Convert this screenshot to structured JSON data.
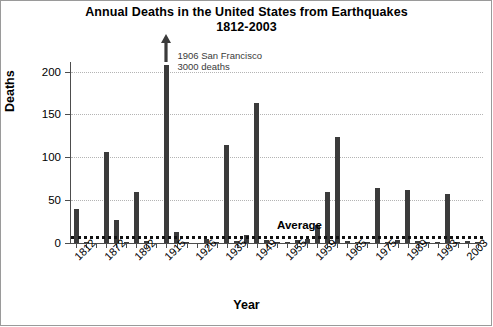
{
  "chart_data": {
    "type": "bar",
    "title": "Annual Deaths in the United States from Earthquakes 1812-2003",
    "title_line1": "Annual Deaths in the United States from Earthquakes",
    "title_line2": "1812-2003",
    "xlabel": "Year",
    "ylabel": "Deaths",
    "ylim": [
      0,
      210
    ],
    "yticks": [
      0,
      50,
      100,
      150,
      200
    ],
    "ytick_labels": [
      "0",
      "50",
      "100",
      "150",
      "200"
    ],
    "grid": "horizontal-dotted",
    "legend": "none",
    "xtick_labels": [
      "1812",
      "1872",
      "1892",
      "1915",
      "1926",
      "1935",
      "1949",
      "1955",
      "1959",
      "1965",
      "1975",
      "1989",
      "1993",
      "2003"
    ],
    "xtick_slots": [
      0,
      3,
      6,
      9,
      12,
      15,
      18,
      21,
      24,
      27,
      30,
      33,
      36,
      39
    ],
    "bar_color": "#3b3b3b",
    "n_slots": 41,
    "values": [
      40,
      1,
      0,
      106,
      27,
      1,
      60,
      2,
      0,
      3000,
      13,
      1,
      0,
      5,
      1,
      114,
      2,
      9,
      163,
      3,
      1,
      1,
      3,
      5,
      21,
      60,
      124,
      2,
      1,
      1,
      64,
      1,
      3,
      62,
      2,
      1,
      1,
      57,
      1,
      2,
      1
    ],
    "clipped_bar": {
      "slot": 9,
      "display_max": 200,
      "true_value": 3000,
      "marker": "up-arrow"
    },
    "annotation": {
      "line1": "1906 San Francisco",
      "line2": "3000 deaths"
    },
    "average": {
      "label": "Average",
      "value": 8
    }
  }
}
